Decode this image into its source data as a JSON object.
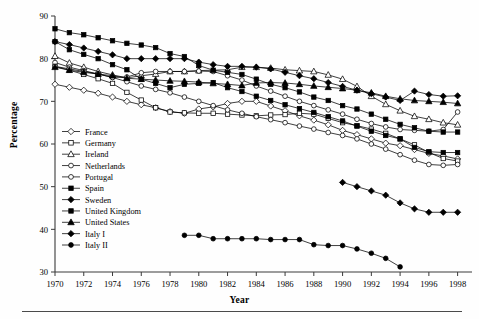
{
  "figure": {
    "ylabel": "Percentage",
    "xlabel": "Year"
  },
  "chart_data": {
    "type": "line",
    "title": "",
    "xlabel": "Year",
    "ylabel": "Percentage",
    "xlim": [
      1970,
      1999
    ],
    "ylim": [
      30,
      90
    ],
    "xticks": [
      1970,
      1972,
      1974,
      1976,
      1978,
      1980,
      1982,
      1984,
      1986,
      1988,
      1990,
      1992,
      1994,
      1996,
      1998
    ],
    "yticks": [
      30,
      40,
      50,
      60,
      70,
      80,
      90
    ],
    "grid": false,
    "legend_position": "lower-left-inside",
    "marker_colors": {
      "line": "#000000",
      "open_fill": "#ffffff",
      "closed_fill": "#000000"
    },
    "series": [
      {
        "name": "France",
        "marker": "diamond-open",
        "x": [
          1970,
          1971,
          1972,
          1973,
          1974,
          1975,
          1976,
          1977,
          1978,
          1979,
          1980,
          1981,
          1982,
          1983,
          1984,
          1985,
          1986,
          1987,
          1988,
          1989,
          1990,
          1991,
          1992,
          1993,
          1994,
          1995,
          1996,
          1997,
          1998
        ],
        "values": [
          74.0,
          73.3,
          72.6,
          71.9,
          71.0,
          70.0,
          69.2,
          68.5,
          67.6,
          67.2,
          68.2,
          68.7,
          69.5,
          70.0,
          70.0,
          68.9,
          67.8,
          66.6,
          65.6,
          64.5,
          63.2,
          62.2,
          61.2,
          60.2,
          59.6,
          58.7,
          57.8,
          57.2,
          56.5
        ]
      },
      {
        "name": "Germany",
        "marker": "square-open",
        "x": [
          1970,
          1971,
          1972,
          1973,
          1974,
          1975,
          1976,
          1977,
          1978,
          1979,
          1980,
          1981,
          1982,
          1983,
          1984,
          1985,
          1986,
          1987,
          1988,
          1989,
          1990,
          1991,
          1992,
          1993,
          1994,
          1995,
          1996,
          1997,
          1998
        ],
        "values": [
          78.2,
          77.3,
          76.3,
          75.3,
          74.2,
          72.1,
          70.3,
          68.5,
          67.5,
          67.3,
          67.2,
          67.2,
          67.0,
          66.8,
          66.6,
          66.8,
          66.9,
          67.2,
          67.0,
          66.0,
          65.0,
          64.3,
          63.5,
          62.5,
          61.2,
          59.8,
          58.0,
          56.6,
          56.0
        ]
      },
      {
        "name": "Ireland",
        "marker": "triangle-open",
        "x": [
          1970,
          1971,
          1972,
          1973,
          1974,
          1975,
          1976,
          1977,
          1978,
          1979,
          1980,
          1981,
          1982,
          1983,
          1984,
          1985,
          1986,
          1987,
          1988,
          1989,
          1990,
          1991,
          1992,
          1993,
          1994,
          1995,
          1996,
          1997,
          1998
        ],
        "values": [
          80.6,
          79.0,
          78.0,
          77.0,
          76.2,
          75.5,
          76.0,
          76.4,
          77.0,
          77.0,
          77.2,
          77.3,
          77.4,
          78.0,
          78.0,
          77.8,
          77.4,
          77.2,
          77.0,
          76.2,
          75.2,
          73.5,
          71.2,
          69.3,
          67.8,
          66.5,
          65.8,
          65.0,
          64.5
        ]
      },
      {
        "name": "Netherlands",
        "marker": "circle-open",
        "x": [
          1970,
          1971,
          1972,
          1973,
          1974,
          1975,
          1976,
          1977,
          1978,
          1979,
          1980,
          1981,
          1982,
          1983,
          1984,
          1985,
          1986,
          1987,
          1988,
          1989,
          1990,
          1991,
          1992,
          1993,
          1994,
          1995,
          1996,
          1997,
          1998
        ],
        "values": [
          79.1,
          78.0,
          77.2,
          76.4,
          75.6,
          75.7,
          76.7,
          77.0,
          77.0,
          77.0,
          77.1,
          77.0,
          76.0,
          75.0,
          73.6,
          72.4,
          71.2,
          70.0,
          69.0,
          68.0,
          67.0,
          65.8,
          64.8,
          64.0,
          63.4,
          63.2,
          63.0,
          63.4,
          67.5
        ]
      },
      {
        "name": "Portugal",
        "marker": "circle-open",
        "x": [
          1970,
          1971,
          1972,
          1973,
          1974,
          1975,
          1976,
          1977,
          1978,
          1979,
          1980,
          1981,
          1982,
          1983,
          1984,
          1985,
          1986,
          1987,
          1988,
          1989,
          1990,
          1991,
          1992,
          1993,
          1994,
          1995,
          1996,
          1997,
          1998
        ],
        "values": [
          78.2,
          77.6,
          77.0,
          76.4,
          75.6,
          74.6,
          73.6,
          72.8,
          72.0,
          71.0,
          70.0,
          69.0,
          68.0,
          67.2,
          66.4,
          65.7,
          65.0,
          64.2,
          63.5,
          62.7,
          62.0,
          61.2,
          60.0,
          58.8,
          57.5,
          56.2,
          55.2,
          55.0,
          55.2
        ]
      },
      {
        "name": "Spain",
        "marker": "square-closed",
        "x": [
          1970,
          1971,
          1972,
          1973,
          1974,
          1975,
          1976,
          1977,
          1978,
          1979,
          1980,
          1981,
          1982,
          1983,
          1984,
          1985,
          1986,
          1987,
          1988,
          1989,
          1990,
          1991,
          1992,
          1993,
          1994,
          1995,
          1996,
          1997,
          1998
        ],
        "values": [
          87.0,
          86.1,
          85.6,
          84.9,
          84.2,
          83.6,
          83.2,
          82.6,
          81.2,
          80.5,
          78.4,
          77.3,
          76.8,
          76.3,
          75.2,
          74.0,
          73.2,
          72.2,
          71.0,
          70.2,
          69.0,
          68.2,
          67.0,
          65.8,
          64.6,
          63.8,
          63.0,
          62.8,
          62.8
        ]
      },
      {
        "name": "Sweden",
        "marker": "diamond-closed",
        "x": [
          1970,
          1971,
          1972,
          1973,
          1974,
          1975,
          1976,
          1977,
          1978,
          1979,
          1980,
          1981,
          1982,
          1983,
          1984,
          1985,
          1986,
          1987,
          1988,
          1989,
          1990,
          1991,
          1992,
          1993,
          1994,
          1995,
          1996,
          1997,
          1998
        ],
        "values": [
          84.0,
          83.3,
          82.5,
          81.7,
          80.9,
          80.0,
          80.0,
          80.0,
          80.0,
          80.0,
          79.2,
          78.6,
          78.2,
          78.2,
          78.0,
          77.6,
          76.8,
          76.0,
          75.3,
          74.4,
          73.5,
          72.6,
          71.8,
          71.0,
          70.2,
          72.4,
          71.6,
          71.2,
          71.3
        ]
      },
      {
        "name": "United Kingdom",
        "marker": "square-closed",
        "x": [
          1970,
          1971,
          1972,
          1973,
          1974,
          1975,
          1976,
          1977,
          1978,
          1979,
          1980,
          1981,
          1982,
          1983,
          1984,
          1985,
          1986,
          1987,
          1988,
          1989,
          1990,
          1991,
          1992,
          1993,
          1994,
          1995,
          1996,
          1997,
          1998
        ],
        "values": [
          84.0,
          82.1,
          81.0,
          80.0,
          78.6,
          77.4,
          75.2,
          74.2,
          73.2,
          74.0,
          74.2,
          74.4,
          73.2,
          72.3,
          71.2,
          70.2,
          69.2,
          68.3,
          67.4,
          66.4,
          65.4,
          64.2,
          63.0,
          62.0,
          61.2,
          59.2,
          58.2,
          58.0,
          58.0
        ]
      },
      {
        "name": "United States",
        "marker": "triangle-closed",
        "x": [
          1970,
          1971,
          1972,
          1973,
          1974,
          1975,
          1976,
          1977,
          1978,
          1979,
          1980,
          1981,
          1982,
          1983,
          1984,
          1985,
          1986,
          1987,
          1988,
          1989,
          1990,
          1991,
          1992,
          1993,
          1994,
          1995,
          1996,
          1997,
          1998
        ],
        "values": [
          78.0,
          77.3,
          76.8,
          76.4,
          76.0,
          75.4,
          75.2,
          75.0,
          74.8,
          74.7,
          74.5,
          74.2,
          74.0,
          73.7,
          74.3,
          74.4,
          74.3,
          74.0,
          73.6,
          73.3,
          73.0,
          72.6,
          72.0,
          71.2,
          70.6,
          70.2,
          70.0,
          69.8,
          69.5
        ]
      },
      {
        "name": "Italy I",
        "marker": "diamond-closed",
        "x": [
          1990,
          1991,
          1992,
          1993,
          1994,
          1995,
          1996,
          1997,
          1998
        ],
        "values": [
          51.0,
          50.0,
          49.0,
          48.0,
          46.2,
          44.8,
          44.0,
          44.0,
          44.0
        ]
      },
      {
        "name": "Italy II",
        "marker": "circle-closed",
        "x": [
          1979,
          1980,
          1981,
          1982,
          1983,
          1984,
          1985,
          1986,
          1987,
          1988,
          1989,
          1990,
          1991,
          1992,
          1993,
          1994
        ],
        "values": [
          38.6,
          38.6,
          37.8,
          37.8,
          37.8,
          37.8,
          37.6,
          37.6,
          37.6,
          36.4,
          36.2,
          36.2,
          35.4,
          34.4,
          33.2,
          31.2
        ]
      }
    ]
  },
  "legend": {
    "items": [
      {
        "label": "France",
        "marker": "diamond-open"
      },
      {
        "label": "Germany",
        "marker": "square-open"
      },
      {
        "label": "Ireland",
        "marker": "triangle-open"
      },
      {
        "label": "Netherlands",
        "marker": "circle-open"
      },
      {
        "label": "Portugal",
        "marker": "circle-open"
      },
      {
        "label": "Spain",
        "marker": "square-closed"
      },
      {
        "label": "Sweden",
        "marker": "diamond-closed"
      },
      {
        "label": "United Kingdom",
        "marker": "square-closed"
      },
      {
        "label": "United States",
        "marker": "triangle-closed"
      },
      {
        "label": "Italy I",
        "marker": "diamond-closed"
      },
      {
        "label": "Italy II",
        "marker": "circle-closed"
      }
    ]
  }
}
